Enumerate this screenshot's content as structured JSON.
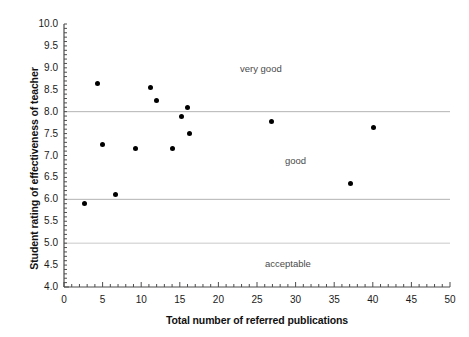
{
  "chart_data": {
    "type": "scatter",
    "title": "",
    "xlabel": "Total number of referred publications",
    "ylabel": "Student rating of effectiveness of teacher",
    "xlim": [
      0,
      50
    ],
    "ylim": [
      4.0,
      10.0
    ],
    "xticks": [
      0,
      5,
      10,
      15,
      20,
      25,
      30,
      35,
      40,
      45,
      50
    ],
    "xtick_labels": [
      "0",
      "5",
      "10",
      "15",
      "20",
      "25",
      "30",
      "35",
      "40",
      "45",
      "50"
    ],
    "yticks": [
      4.0,
      4.5,
      5.0,
      5.5,
      6.0,
      6.5,
      7.0,
      7.5,
      8.0,
      8.5,
      9.0,
      9.5,
      10.0
    ],
    "ytick_labels": [
      "4.0",
      "4.5",
      "5.0",
      "5.5",
      "6.0",
      "6.5",
      "7.0",
      "7.5",
      "8.0",
      "8.5",
      "9.0",
      "9.5",
      "10.0"
    ],
    "x_minor_tick_step": 1,
    "y_minor_tick_step": 0.1,
    "grid": false,
    "legend": false,
    "marker": "filled-circle",
    "marker_color": "#000000",
    "marker_size_px": 5,
    "points": [
      {
        "x": 2.6,
        "y": 5.9
      },
      {
        "x": 4.3,
        "y": 8.65
      },
      {
        "x": 5.0,
        "y": 7.25
      },
      {
        "x": 6.7,
        "y": 6.1
      },
      {
        "x": 9.3,
        "y": 7.15
      },
      {
        "x": 11.2,
        "y": 8.55
      },
      {
        "x": 12.0,
        "y": 8.25
      },
      {
        "x": 14.0,
        "y": 7.15
      },
      {
        "x": 15.2,
        "y": 7.9
      },
      {
        "x": 16.0,
        "y": 8.1
      },
      {
        "x": 16.2,
        "y": 7.5
      },
      {
        "x": 26.9,
        "y": 7.78
      },
      {
        "x": 37.1,
        "y": 6.35
      },
      {
        "x": 40.1,
        "y": 7.65
      }
    ],
    "reference_lines": [
      {
        "y": 8.0,
        "color": "#b3b3b3"
      },
      {
        "y": 6.0,
        "color": "#b3b3b3"
      },
      {
        "y": 5.0,
        "color": "#c9c9c9"
      }
    ],
    "annotations": [
      {
        "text": "very good",
        "x": 25.5,
        "y": 9.0,
        "color": "#4a4a4a"
      },
      {
        "text": "good",
        "x": 30.0,
        "y": 6.9,
        "color": "#4a4a4a"
      },
      {
        "text": "acceptable",
        "x": 29.0,
        "y": 4.55,
        "color": "#4a4a4a"
      }
    ],
    "axis_color": "#4d4d4d"
  }
}
